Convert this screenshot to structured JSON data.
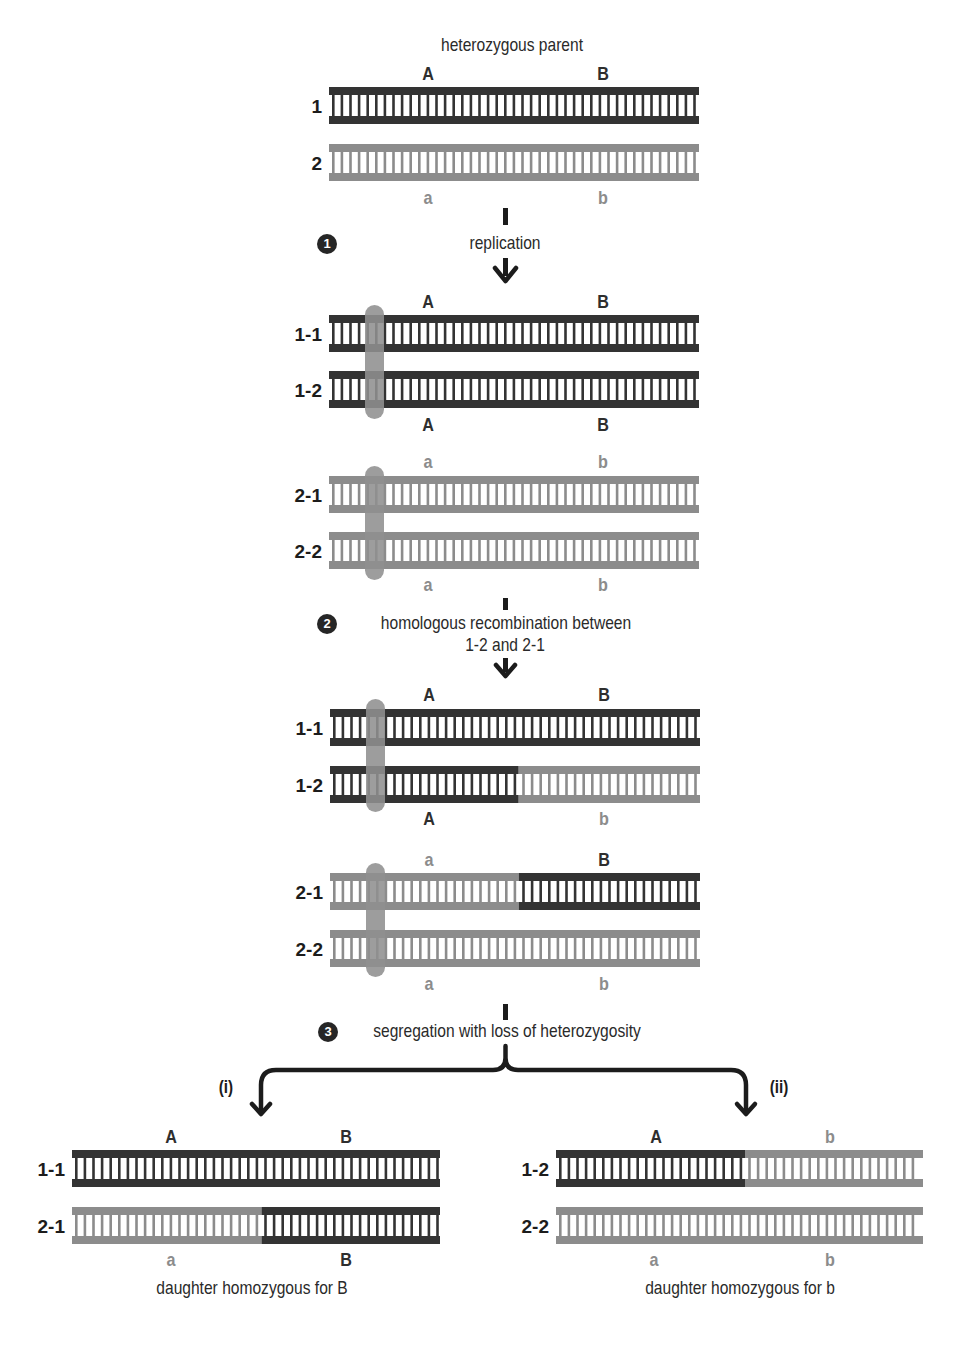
{
  "colors": {
    "dark": "#333333",
    "light": "#8c8c8c",
    "cohesin": "#8f8f8f",
    "text": "#2a2a2a",
    "badge": "#262626"
  },
  "titles": {
    "parent": "heterozygous parent",
    "daughter_left": "daughter homozygous for B",
    "daughter_right": "daughter homozygous for b"
  },
  "steps": [
    {
      "number": "1",
      "label": "replication"
    },
    {
      "number": "2",
      "label_line1": "homologous recombination between",
      "label_line2": "1-2 and 2-1"
    },
    {
      "number": "3",
      "label": "segregation with loss of heterozygosity"
    }
  ],
  "branches": {
    "left": "(i)",
    "right": "(ii)"
  },
  "ladders": [
    {
      "id": "parent-1",
      "row_label": "1",
      "x": 329,
      "y": 87,
      "w": 370,
      "segments": [
        {
          "from": 0,
          "to": 1,
          "tone": "dark"
        }
      ]
    },
    {
      "id": "parent-2",
      "row_label": "2",
      "x": 329,
      "y": 144,
      "w": 370,
      "segments": [
        {
          "from": 0,
          "to": 1,
          "tone": "light"
        }
      ]
    },
    {
      "id": "rep-1-1",
      "row_label": "1-1",
      "x": 329,
      "y": 315,
      "w": 370,
      "segments": [
        {
          "from": 0,
          "to": 1,
          "tone": "dark"
        }
      ]
    },
    {
      "id": "rep-1-2",
      "row_label": "1-2",
      "x": 329,
      "y": 371,
      "w": 370,
      "segments": [
        {
          "from": 0,
          "to": 1,
          "tone": "dark"
        }
      ]
    },
    {
      "id": "rep-2-1",
      "row_label": "2-1",
      "x": 329,
      "y": 476,
      "w": 370,
      "segments": [
        {
          "from": 0,
          "to": 1,
          "tone": "light"
        }
      ]
    },
    {
      "id": "rep-2-2",
      "row_label": "2-2",
      "x": 329,
      "y": 532,
      "w": 370,
      "segments": [
        {
          "from": 0,
          "to": 1,
          "tone": "light"
        }
      ]
    },
    {
      "id": "rec-1-1",
      "row_label": "1-1",
      "x": 330,
      "y": 709,
      "w": 370,
      "segments": [
        {
          "from": 0,
          "to": 1,
          "tone": "dark"
        }
      ]
    },
    {
      "id": "rec-1-2",
      "row_label": "1-2",
      "x": 330,
      "y": 766,
      "w": 370,
      "segments": [
        {
          "from": 0,
          "to": 0.51,
          "tone": "dark"
        },
        {
          "from": 0.51,
          "to": 1,
          "tone": "light"
        }
      ]
    },
    {
      "id": "rec-2-1",
      "row_label": "2-1",
      "x": 330,
      "y": 873,
      "w": 370,
      "segments": [
        {
          "from": 0,
          "to": 0.51,
          "tone": "light"
        },
        {
          "from": 0.51,
          "to": 1,
          "tone": "dark"
        }
      ]
    },
    {
      "id": "rec-2-2",
      "row_label": "2-2",
      "x": 330,
      "y": 930,
      "w": 370,
      "segments": [
        {
          "from": 0,
          "to": 1,
          "tone": "light"
        }
      ]
    },
    {
      "id": "dL-1-1",
      "row_label": "1-1",
      "x": 72,
      "y": 1150,
      "w": 368,
      "segments": [
        {
          "from": 0,
          "to": 1,
          "tone": "dark"
        }
      ]
    },
    {
      "id": "dL-2-1",
      "row_label": "2-1",
      "x": 72,
      "y": 1207,
      "w": 368,
      "segments": [
        {
          "from": 0,
          "to": 0.515,
          "tone": "light"
        },
        {
          "from": 0.515,
          "to": 1,
          "tone": "dark"
        }
      ]
    },
    {
      "id": "dR-1-2",
      "row_label": "1-2",
      "x": 556,
      "y": 1150,
      "w": 367,
      "segments": [
        {
          "from": 0,
          "to": 0.515,
          "tone": "dark"
        },
        {
          "from": 0.515,
          "to": 1,
          "tone": "light"
        }
      ]
    },
    {
      "id": "dR-2-2",
      "row_label": "2-2",
      "x": 556,
      "y": 1207,
      "w": 367,
      "segments": [
        {
          "from": 0,
          "to": 1,
          "tone": "light"
        }
      ]
    }
  ],
  "alleles": [
    {
      "text": "A",
      "x": 428,
      "y": 64,
      "tone": "dark"
    },
    {
      "text": "B",
      "x": 603,
      "y": 64,
      "tone": "dark"
    },
    {
      "text": "a",
      "x": 428,
      "y": 188,
      "tone": "light"
    },
    {
      "text": "b",
      "x": 603,
      "y": 188,
      "tone": "light"
    },
    {
      "text": "A",
      "x": 428,
      "y": 292,
      "tone": "dark"
    },
    {
      "text": "B",
      "x": 603,
      "y": 292,
      "tone": "dark"
    },
    {
      "text": "A",
      "x": 428,
      "y": 415,
      "tone": "dark"
    },
    {
      "text": "B",
      "x": 603,
      "y": 415,
      "tone": "dark"
    },
    {
      "text": "a",
      "x": 428,
      "y": 452,
      "tone": "light"
    },
    {
      "text": "b",
      "x": 603,
      "y": 452,
      "tone": "light"
    },
    {
      "text": "a",
      "x": 428,
      "y": 575,
      "tone": "light"
    },
    {
      "text": "b",
      "x": 603,
      "y": 575,
      "tone": "light"
    },
    {
      "text": "A",
      "x": 429,
      "y": 685,
      "tone": "dark"
    },
    {
      "text": "B",
      "x": 604,
      "y": 685,
      "tone": "dark"
    },
    {
      "text": "A",
      "x": 429,
      "y": 809,
      "tone": "dark"
    },
    {
      "text": "b",
      "x": 604,
      "y": 809,
      "tone": "light"
    },
    {
      "text": "a",
      "x": 429,
      "y": 850,
      "tone": "light"
    },
    {
      "text": "B",
      "x": 604,
      "y": 850,
      "tone": "dark"
    },
    {
      "text": "a",
      "x": 429,
      "y": 974,
      "tone": "light"
    },
    {
      "text": "b",
      "x": 604,
      "y": 974,
      "tone": "light"
    },
    {
      "text": "A",
      "x": 171,
      "y": 1127,
      "tone": "dark"
    },
    {
      "text": "B",
      "x": 346,
      "y": 1127,
      "tone": "dark"
    },
    {
      "text": "a",
      "x": 171,
      "y": 1250,
      "tone": "light"
    },
    {
      "text": "B",
      "x": 346,
      "y": 1250,
      "tone": "dark"
    },
    {
      "text": "A",
      "x": 656,
      "y": 1127,
      "tone": "dark"
    },
    {
      "text": "b",
      "x": 830,
      "y": 1127,
      "tone": "light"
    },
    {
      "text": "a",
      "x": 654,
      "y": 1250,
      "tone": "light"
    },
    {
      "text": "b",
      "x": 830,
      "y": 1250,
      "tone": "light"
    }
  ],
  "cohesins": [
    {
      "x": 365,
      "y": 305,
      "w": 19,
      "h": 114
    },
    {
      "x": 365,
      "y": 466,
      "w": 19,
      "h": 114
    },
    {
      "x": 366,
      "y": 699,
      "w": 19,
      "h": 113
    },
    {
      "x": 366,
      "y": 863,
      "w": 19,
      "h": 114
    }
  ]
}
